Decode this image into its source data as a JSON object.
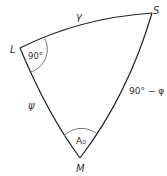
{
  "diagram": {
    "type": "spherical-triangle",
    "vertices": {
      "L": {
        "label": "L",
        "x": 20,
        "y": 48
      },
      "S": {
        "label": "S",
        "x": 152,
        "y": 13
      },
      "M": {
        "label": "M",
        "x": 80,
        "y": 158
      }
    },
    "sides": {
      "LS": {
        "label": "γ"
      },
      "LM": {
        "label": "ψ"
      },
      "SM": {
        "label": "90° − φ"
      }
    },
    "angles": {
      "L": {
        "label": "90°"
      },
      "M": {
        "label": "A₀"
      }
    },
    "colors": {
      "stroke": "#222222",
      "arc": "#666666",
      "text": "#333333"
    }
  }
}
